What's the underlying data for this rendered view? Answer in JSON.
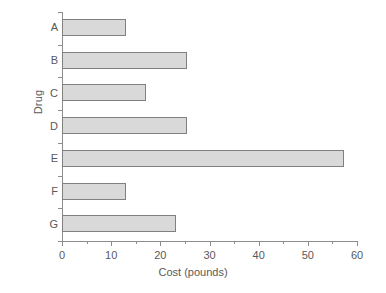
{
  "chart_data": {
    "type": "bar",
    "orientation": "horizontal",
    "title": "",
    "xlabel": "Cost (pounds)",
    "ylabel": "Drug",
    "categories": [
      "A",
      "B",
      "C",
      "D",
      "E",
      "F",
      "G"
    ],
    "values": [
      13,
      25.5,
      17,
      25.5,
      57.3,
      13,
      23.2
    ],
    "xlim": [
      0,
      60
    ],
    "xticks": [
      0,
      10,
      20,
      30,
      40,
      50,
      60
    ],
    "xtick_labels": [
      "0",
      "10",
      "20",
      "30",
      "40",
      "50",
      "60"
    ],
    "xminor_ticks": [
      5,
      15,
      25,
      35,
      45,
      55
    ],
    "grid": false,
    "legend": null,
    "bar_fill_color": "#d9d9d9",
    "bar_edge_color": "#808080",
    "axis_color": "#8c8c8c",
    "text_color": "#595959",
    "background_color": "#ffffff"
  }
}
